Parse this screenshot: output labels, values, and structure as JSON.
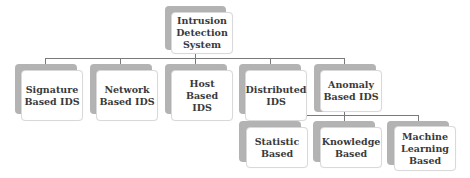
{
  "diagram": {
    "type": "tree",
    "root": {
      "id": "ids",
      "label": "Intrusion\nDetection\nSystem"
    },
    "level1": [
      {
        "id": "signature",
        "label": "Signature\nBased IDS"
      },
      {
        "id": "network",
        "label": "Network\nBased IDS"
      },
      {
        "id": "host",
        "label": "Host Based\nIDS"
      },
      {
        "id": "distributed",
        "label": "Distributed\nIDS"
      },
      {
        "id": "anomaly",
        "label": "Anomaly\nBased IDS"
      }
    ],
    "level2_parent": "anomaly",
    "level2": [
      {
        "id": "statistic",
        "label": "Statistic\nBased"
      },
      {
        "id": "knowledge",
        "label": "Knowledge\nBased"
      },
      {
        "id": "ml",
        "label": "Machine\nLearning\nBased"
      }
    ],
    "colors": {
      "shadow": "#b3b3b3",
      "box": "#ffffff",
      "connector": "#7a7a7a",
      "text": "#3a3a3a"
    }
  }
}
